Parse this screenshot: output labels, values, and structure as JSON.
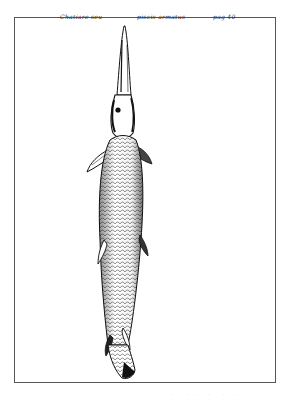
{
  "plate": {
    "caption_left": "Chatiare seu",
    "caption_middle": "piscis armatus",
    "caption_right": "pag 40",
    "illustration": "engraving-armored-fish-gar",
    "footer_marks": "· ·· ·  ·  ·"
  },
  "colors": {
    "ink": "#111111",
    "frame": "#555555",
    "paper": "#ffffff"
  }
}
